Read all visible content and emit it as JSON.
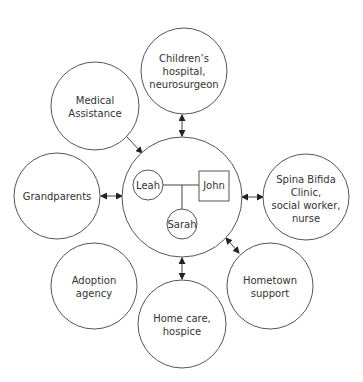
{
  "diagram": {
    "type": "ecomap",
    "center": {
      "family": {
        "mother": "Leah",
        "father": "John",
        "child": "Sarah"
      }
    },
    "nodes": [
      {
        "id": "childrens-hospital",
        "lines": [
          "Children’s",
          "hospital,",
          "neurosurgeon"
        ],
        "connection": "bidirectional"
      },
      {
        "id": "medical-assistance",
        "lines": [
          "Medical",
          "Assistance"
        ],
        "connection": "to-family"
      },
      {
        "id": "grandparents",
        "lines": [
          "Grandparents"
        ],
        "connection": "bidirectional"
      },
      {
        "id": "adoption-agency",
        "lines": [
          "Adoption",
          "agency"
        ],
        "connection": "none"
      },
      {
        "id": "home-care",
        "lines": [
          "Home care,",
          "hospice"
        ],
        "connection": "bidirectional"
      },
      {
        "id": "hometown-support",
        "lines": [
          "Hometown",
          "support"
        ],
        "connection": "bidirectional"
      },
      {
        "id": "spina-bifida-clinic",
        "lines": [
          "Spina Bifida",
          "Clinic,",
          "social worker,",
          "nurse"
        ],
        "connection": "bidirectional"
      }
    ]
  }
}
